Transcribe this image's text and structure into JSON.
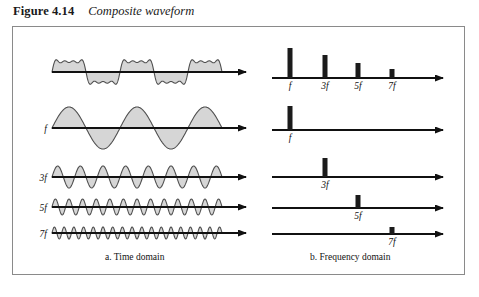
{
  "figure": {
    "number": "Figure 4.14",
    "title": "Composite waveform"
  },
  "panels": {
    "time": {
      "caption": "a. Time domain"
    },
    "frequency": {
      "caption": "b. Frequency domain"
    }
  },
  "colors": {
    "wave_fill": "#d6d6d6",
    "wave_stroke": "#4f4f4f",
    "axis": "#111111",
    "bar": "#1b1b1b",
    "frame_border": "#8a8a8a",
    "background": "#ffffff"
  },
  "time_domain": {
    "rows": [
      {
        "id": "composite",
        "label": "",
        "wave": "composite",
        "harmonic": 0,
        "cycles": 2.5,
        "amplitude": 22,
        "baseline_y": 72
      },
      {
        "id": "fundamental",
        "label": "f",
        "wave": "sine",
        "harmonic": 1,
        "cycles": 2.5,
        "amplitude": 21,
        "baseline_y": 128
      },
      {
        "id": "third",
        "label": "3f",
        "wave": "sine",
        "harmonic": 3,
        "cycles": 7.5,
        "amplitude": 11,
        "baseline_y": 177
      },
      {
        "id": "fifth",
        "label": "5f",
        "wave": "sine",
        "harmonic": 5,
        "cycles": 12.5,
        "amplitude": 8,
        "baseline_y": 207
      },
      {
        "id": "seventh",
        "label": "7f",
        "wave": "sine",
        "harmonic": 7,
        "cycles": 17.5,
        "amplitude": 6,
        "baseline_y": 233
      }
    ],
    "axis_start_x": 52,
    "axis_end_x": 255,
    "wave_end_x": 222
  },
  "frequency_domain": {
    "axis_start_x": 272,
    "axis_end_x": 452,
    "rows": [
      {
        "id": "composite-spectrum",
        "baseline_y": 78,
        "lines": [
          {
            "label": "f",
            "x": 290,
            "height": 30,
            "width": 5
          },
          {
            "label": "3f",
            "x": 325,
            "height": 23,
            "width": 5
          },
          {
            "label": "5f",
            "x": 358,
            "height": 15,
            "width": 5
          },
          {
            "label": "7f",
            "x": 392,
            "height": 9,
            "width": 5
          }
        ]
      },
      {
        "id": "fundamental-spectrum",
        "baseline_y": 130,
        "lines": [
          {
            "label": "f",
            "x": 290,
            "height": 24,
            "width": 5
          }
        ]
      },
      {
        "id": "third-spectrum",
        "baseline_y": 177,
        "lines": [
          {
            "label": "3f",
            "x": 325,
            "height": 19,
            "width": 5
          }
        ]
      },
      {
        "id": "fifth-spectrum",
        "baseline_y": 208,
        "lines": [
          {
            "label": "5f",
            "x": 358,
            "height": 13,
            "width": 5
          }
        ]
      },
      {
        "id": "seventh-spectrum",
        "baseline_y": 234,
        "lines": [
          {
            "label": "7f",
            "x": 392,
            "height": 7,
            "width": 5
          }
        ]
      }
    ]
  },
  "chart_data": {
    "type": "line",
    "title": "Composite waveform",
    "xlabel": "",
    "ylabel": "",
    "series": [
      {
        "name": "Composite",
        "harmonic": 0,
        "relative_amplitude": 1.0,
        "cycles": 2.5
      },
      {
        "name": "f",
        "harmonic": 1,
        "relative_amplitude": 1.0,
        "cycles": 2.5
      },
      {
        "name": "3f",
        "harmonic": 3,
        "relative_amplitude": 0.33,
        "cycles": 7.5
      },
      {
        "name": "5f",
        "harmonic": 5,
        "relative_amplitude": 0.2,
        "cycles": 12.5
      },
      {
        "name": "7f",
        "harmonic": 7,
        "relative_amplitude": 0.14,
        "cycles": 17.5
      }
    ],
    "spectrum": {
      "type": "bar",
      "categories": [
        "f",
        "3f",
        "5f",
        "7f"
      ],
      "values": [
        1.0,
        0.77,
        0.5,
        0.3
      ]
    }
  }
}
